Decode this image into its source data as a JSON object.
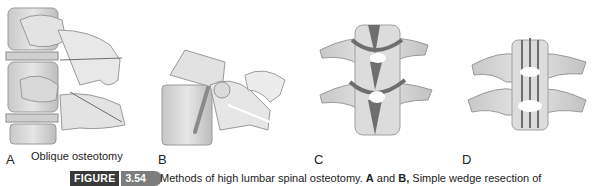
{
  "figure": {
    "label": "FIGURE",
    "number": "3.54",
    "caption_part1": "Methods of high lumbar spinal osteotomy. ",
    "caption_bold1": "A",
    "caption_part2": " and ",
    "caption_bold2": "B,",
    "caption_part3": " Simple wedge resection of"
  },
  "panels": [
    {
      "letter": "A",
      "sub_caption": "Oblique osteotomy",
      "subject": "lateral view of lumbar vertebrae with oblique osteotomy"
    },
    {
      "letter": "B",
      "sub_caption": "",
      "subject": "lateral view of vertebra wedge resection with rod"
    },
    {
      "letter": "C",
      "sub_caption": "",
      "subject": "posterior view of two vertebrae with resection channel"
    },
    {
      "letter": "D",
      "sub_caption": "",
      "subject": "posterior view of two vertebrae after closure"
    }
  ],
  "colors": {
    "bone": "#dcdcdc",
    "bone_shadow": "#b5b5b5",
    "cut": "#6e6e6e",
    "badge_dark": "#3a3a3a",
    "badge_grey": "#7d7d7d"
  }
}
